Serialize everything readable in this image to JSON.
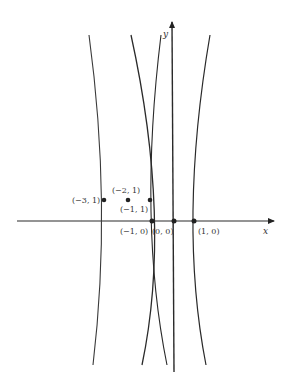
{
  "figure": {
    "type": "diagram",
    "axes": {
      "x_label": "x",
      "y_label": "y"
    },
    "points": [
      {
        "label": "(−3, 1)",
        "x": -3,
        "y": 1
      },
      {
        "label": "(−2, 1)",
        "x": -2,
        "y": 1
      },
      {
        "label": "(−1, 1)",
        "x": -1,
        "y": 1
      },
      {
        "label": "(−1, 0)",
        "x": -1,
        "y": 0
      },
      {
        "label": "(0, 0)",
        "x": 0,
        "y": 0
      },
      {
        "label": "(1, 0)",
        "x": 1,
        "y": 0
      }
    ],
    "curve_count": 4,
    "colors": {
      "line": "#2a2a2a",
      "background": "#ffffff"
    }
  }
}
